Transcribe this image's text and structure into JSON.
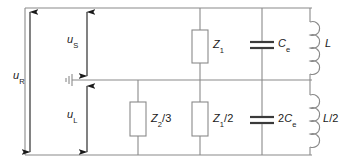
{
  "diagram": {
    "type": "electrical-circuit-schematic",
    "title": "",
    "colors": {
      "wire": "#8a8a8a",
      "component_stroke": "#8a8a8a",
      "arrow": "#1a1a1a",
      "text": "#1a1a1a",
      "background": "#ffffff"
    },
    "voltage_arrows": [
      {
        "name": "u-R",
        "base": "u",
        "sub": "R",
        "label": "uR",
        "orientation": "vertical",
        "double_headed": true,
        "x": 30,
        "y_top": 12,
        "y_bottom": 152,
        "label_x": 14,
        "label_y": 76
      },
      {
        "name": "u-S",
        "base": "u",
        "sub": "S",
        "label": "uS",
        "orientation": "vertical",
        "double_headed": true,
        "x": 87,
        "y_top": 12,
        "y_bottom": 76,
        "label_x": 68,
        "label_y": 39
      },
      {
        "name": "u-L",
        "base": "u",
        "sub": "L",
        "label": "uL",
        "orientation": "vertical",
        "double_headed": true,
        "x": 87,
        "y_top": 86,
        "y_bottom": 152,
        "label_x": 68,
        "label_y": 114
      }
    ],
    "components": [
      {
        "name": "impedance-z1",
        "kind": "impedance-box",
        "branch": "upper",
        "label": "Z1",
        "base": "Z",
        "sub": "1",
        "suffix": "",
        "x": 200,
        "label_x": 212,
        "label_y": 44
      },
      {
        "name": "capacitor-ce",
        "kind": "capacitor",
        "branch": "upper",
        "label": "Ce",
        "prefix": "",
        "base": "C",
        "sub": "e",
        "x": 262,
        "label_x": 272,
        "label_y": 44
      },
      {
        "name": "inductor-l",
        "kind": "inductor",
        "branch": "upper",
        "label": "L",
        "base": "L",
        "sub": "",
        "suffix": "",
        "x": 310,
        "label_x": 324,
        "label_y": 44
      },
      {
        "name": "impedance-z2-over-3",
        "kind": "impedance-box",
        "branch": "lower",
        "label": "Z2/3",
        "base": "Z",
        "sub": "2",
        "suffix": "/3",
        "x": 138,
        "label_x": 150,
        "label_y": 119
      },
      {
        "name": "impedance-z1-over-2",
        "kind": "impedance-box",
        "branch": "lower",
        "label": "Z1/2",
        "base": "Z",
        "sub": "1",
        "suffix": "/2",
        "x": 200,
        "label_x": 212,
        "label_y": 119
      },
      {
        "name": "capacitor-2ce",
        "kind": "capacitor",
        "branch": "lower",
        "label": "2Ce",
        "prefix": "2",
        "base": "C",
        "sub": "e",
        "x": 262,
        "label_x": 272,
        "label_y": 119
      },
      {
        "name": "inductor-l-over-2",
        "kind": "inductor",
        "branch": "lower",
        "label": "L/2",
        "base": "L",
        "sub": "",
        "suffix": "/2",
        "x": 310,
        "label_x": 324,
        "label_y": 119
      }
    ],
    "ground": {
      "name": "ground-symbol",
      "x": 72,
      "y": 80
    },
    "rails": {
      "top_y": 8,
      "middle_y": 80,
      "bottom_y": 155,
      "left_x": 25,
      "right_x": 310
    }
  }
}
